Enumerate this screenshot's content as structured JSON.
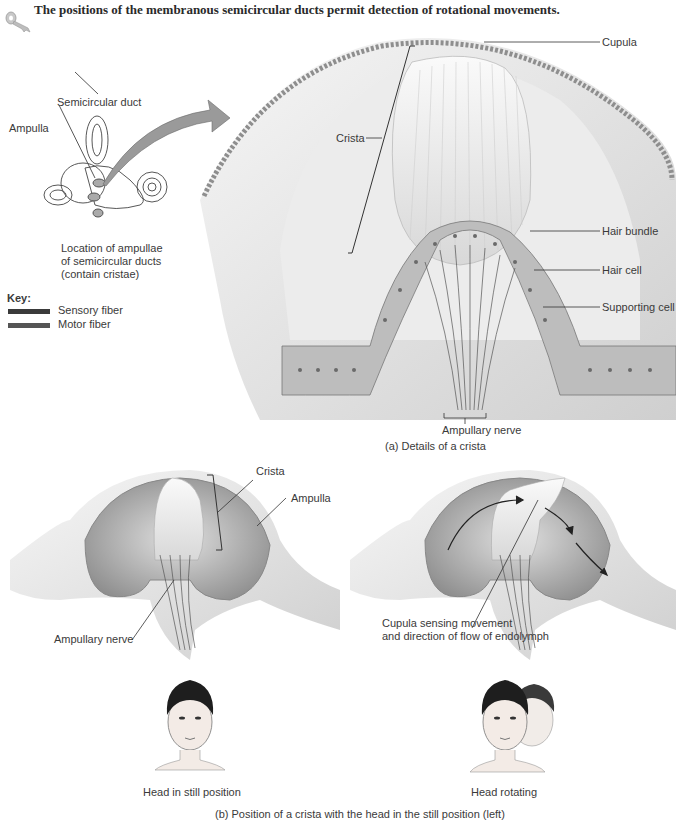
{
  "title": "The positions of the membranous semicircular ducts permit detection of rotational movements.",
  "icon": "key-icon",
  "inset": {
    "labels": {
      "semicircular_duct": "Semicircular duct",
      "ampulla": "Ampulla"
    },
    "caption_lines": [
      "Location of ampullae",
      "of semicircular ducts",
      "(contain cristae)"
    ]
  },
  "key": {
    "heading": "Key:",
    "items": [
      {
        "label": "Sensory fiber",
        "color": "#3a3a3a"
      },
      {
        "label": "Motor fiber",
        "color": "#555555"
      }
    ]
  },
  "panel_a": {
    "labels": {
      "crista": "Crista",
      "cupula": "Cupula",
      "hair_bundle": "Hair bundle",
      "hair_cell": "Hair cell",
      "supporting_cell": "Supporting cell",
      "ampullary_nerve": "Ampullary nerve"
    },
    "caption": "(a) Details of a crista"
  },
  "panel_b": {
    "left": {
      "labels": {
        "crista": "Crista",
        "ampulla": "Ampulla",
        "ampullary_nerve": "Ampullary nerve"
      },
      "caption": "Head in still position"
    },
    "right": {
      "labels": {
        "cupula_line1": "Cupula sensing movement",
        "cupula_line2": "and direction of flow of endolymph"
      },
      "caption": "Head rotating"
    },
    "caption": "(b) Position of a crista with the head in the still position (left)"
  }
}
